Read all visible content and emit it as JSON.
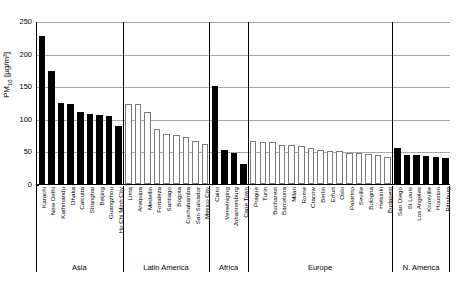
{
  "chart_data": {
    "type": "bar",
    "title": "",
    "xlabel": "",
    "ylabel": "PM10 [ug/m3]",
    "ylabel_base": "PM",
    "ylabel_sub": "10",
    "ylabel_unit": " [µg/m³]",
    "ylim": [
      0,
      250
    ],
    "yticks": [
      0,
      50,
      100,
      150,
      200,
      250
    ],
    "ytick_labels": [
      "0",
      "50",
      "100",
      "150",
      "200",
      "250"
    ],
    "grid": true,
    "grid_axis": "y",
    "legend": "none",
    "colors": {
      "filled_bar": "#000000",
      "hollow_bar_fill": "#ffffff",
      "hollow_bar_edge": "#7a7a7a",
      "gridline": "#a8a8a8",
      "axis": "#000000"
    },
    "regions": [
      {
        "name": "Asia",
        "style": "filled",
        "categories": [
          "Karachi",
          "New Delhi",
          "Kathmandu",
          "Dhaka",
          "Calcutta",
          "Shanghai",
          "Beijing",
          "Guangzhou",
          "Ho Chi Minh City"
        ],
        "values": [
          227,
          174,
          125,
          123,
          110,
          108,
          106,
          105,
          89
        ]
      },
      {
        "name": "Latin America",
        "style": "hollow",
        "categories": [
          "Lima",
          "Arequipa",
          "Medellin",
          "Fortaleza",
          "Santiago",
          "Bogota",
          "Cochabamba",
          "San Salvador",
          "Mexico City"
        ],
        "values": [
          122,
          122,
          110,
          85,
          77,
          75,
          72,
          66,
          62
        ]
      },
      {
        "name": "Africa",
        "style": "filled",
        "categories": [
          "Cairo",
          "Vereeniging",
          "Johannesburg",
          "Cape Town"
        ],
        "values": [
          150,
          52,
          48,
          30
        ]
      },
      {
        "name": "Europe",
        "style": "hollow",
        "categories": [
          "Prague",
          "Turin",
          "Bucharest",
          "Barcelona",
          "Milan",
          "Rome",
          "Cracow",
          "Berlin",
          "Erfurt",
          "Oslo",
          "Palermo",
          "Seville",
          "Bologna",
          "Helsinki",
          "Budapest"
        ],
        "values": [
          66,
          65,
          64,
          60,
          60,
          59,
          56,
          52,
          51,
          50,
          48,
          47,
          46,
          44,
          42
        ]
      },
      {
        "name": "N. America",
        "style": "filled",
        "categories": [
          "San Diego",
          "St Louis",
          "Los Angeles",
          "Knoxville",
          "Houston",
          "Pittsburg"
        ],
        "values": [
          55,
          45,
          44,
          43,
          42,
          40
        ]
      }
    ]
  }
}
